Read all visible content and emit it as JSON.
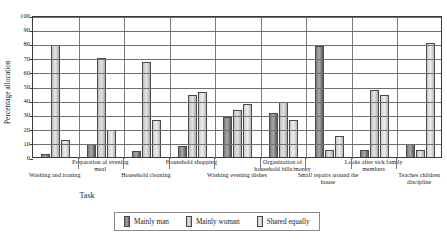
{
  "chart_data": {
    "type": "bar",
    "title": "",
    "xlabel": "Task",
    "ylabel": "Percentage allocation",
    "ylim": [
      0,
      100
    ],
    "ytick_step": 10,
    "yticks": [
      100,
      90,
      80,
      70,
      60,
      50,
      40,
      30,
      20,
      10,
      0
    ],
    "grid": true,
    "legend_position": "bottom",
    "categories": [
      "Washing and ironing",
      "Preparation of evening meal",
      "Household cleaning",
      "Household shopping",
      "Washing evening dishes",
      "Organization of household bills/money",
      "Small repairs around the house",
      "Looks after sick family members",
      "Teaches children discipline"
    ],
    "series": [
      {
        "name": "Mainly man",
        "color": "#8e8e8e",
        "values": [
          2,
          9,
          4,
          8,
          28,
          31,
          78,
          5,
          9
        ]
      },
      {
        "name": "Mainly woman",
        "color": "#d4d4d4",
        "values": [
          79,
          70,
          67,
          44,
          33,
          39,
          5,
          47,
          5
        ]
      },
      {
        "name": "Shared equally",
        "color": "#e4e4e4",
        "values": [
          12,
          19,
          26,
          46,
          37,
          26,
          15,
          44,
          80
        ]
      }
    ]
  },
  "axis": {
    "y_title": "Percentage allocation",
    "x_title": "Task"
  },
  "category_labels": [
    {
      "text": "Washing and ironing",
      "row": "bottom"
    },
    {
      "text": "Preparation of evening meal",
      "row": "top"
    },
    {
      "text": "Household cleaning",
      "row": "bottom"
    },
    {
      "text": "Household shopping",
      "row": "top"
    },
    {
      "text": "Washing evening dishes",
      "row": "bottom"
    },
    {
      "text": "Organization of household bills/money",
      "row": "top"
    },
    {
      "text": "Small repairs around the house",
      "row": "bottom"
    },
    {
      "text": "Looks after sick family members",
      "row": "top"
    },
    {
      "text": "Teaches children discipline",
      "row": "bottom"
    }
  ],
  "legend": {
    "items": [
      {
        "label": "Mainly man",
        "color": "#8e8e8e"
      },
      {
        "label": "Mainly woman",
        "color": "#d4d4d4"
      },
      {
        "label": "Shared equally",
        "color": "#e4e4e4"
      }
    ]
  }
}
